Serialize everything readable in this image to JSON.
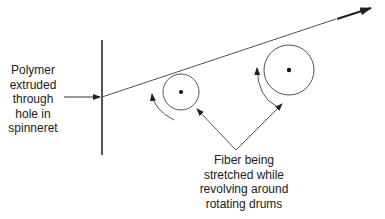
{
  "labels": {
    "polymer": [
      "Polymer",
      "extruded",
      "through",
      "hole in",
      "spinneret"
    ],
    "fiber": [
      "Fiber being",
      "stretched while",
      "revolving around",
      "rotating drums"
    ]
  },
  "elements": {
    "spinneret": "spinneret-plate",
    "small_drum": "rotating-drum-small",
    "large_drum": "rotating-drum-large",
    "fiber": "fiber-line",
    "direction": "fiber-direction-arrow"
  },
  "colors": {
    "line": "#555555",
    "text": "#222222",
    "background": "#ffffff"
  }
}
